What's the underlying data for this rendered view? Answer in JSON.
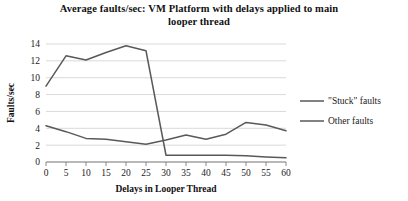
{
  "chart_data": {
    "type": "line",
    "title": "Average faults/sec: VM Platform with delays applied to main looper thread",
    "title_line1": "Average faults/sec: VM Platform with delays applied to main",
    "title_line2": "looper thread",
    "xlabel": "Delays in Looper Thread",
    "ylabel": "Faults/sec",
    "x": [
      0,
      5,
      10,
      15,
      20,
      25,
      30,
      35,
      40,
      45,
      50,
      55,
      60
    ],
    "xticklabels": [
      "0",
      "5",
      "10",
      "15",
      "20",
      "25",
      "30",
      "35",
      "40",
      "45",
      "50",
      "55",
      "60"
    ],
    "yticklabels": [
      "0",
      "2",
      "4",
      "6",
      "8",
      "10",
      "12",
      "14"
    ],
    "yticks": [
      0,
      2,
      4,
      6,
      8,
      10,
      12,
      14
    ],
    "xlim": [
      0,
      60
    ],
    "ylim": [
      0,
      14
    ],
    "grid": "horizontal",
    "legend_position": "right",
    "series": [
      {
        "name": "\"Stuck\" faults",
        "color": "#595959",
        "values": [
          9.0,
          12.6,
          12.1,
          13.0,
          13.8,
          13.2,
          0.8,
          0.8,
          0.8,
          0.8,
          0.75,
          0.6,
          0.5
        ]
      },
      {
        "name": "Other faults",
        "color": "#595959",
        "values": [
          4.3,
          3.6,
          2.8,
          2.7,
          2.4,
          2.1,
          2.6,
          3.2,
          2.7,
          3.3,
          4.7,
          4.4,
          3.7
        ]
      }
    ]
  }
}
